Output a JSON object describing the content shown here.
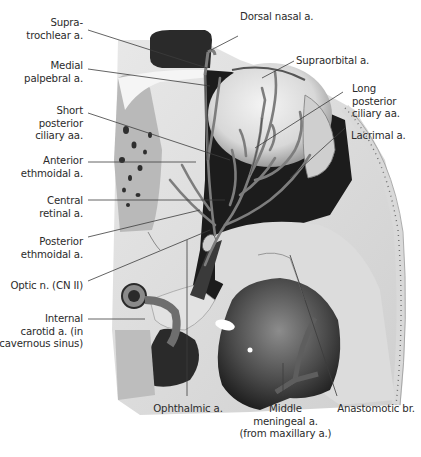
{
  "figure": {
    "palette": {
      "background": "#ffffff",
      "bone_light": "#e6e6e6",
      "bone_mid": "#c9c9c9",
      "shadow_dark": "#1e1e1e",
      "vessel": "#7d7d7d",
      "vessel_edge": "#3a3a3a",
      "leader_line": "#3c3c3c",
      "label_text": "#2b2b2b"
    }
  },
  "labels": {
    "left": [
      {
        "id": "supratrochlear",
        "text": "Supra-\ntrochlear a."
      },
      {
        "id": "medial-palpebral",
        "text": "Medial\npalpebral a."
      },
      {
        "id": "short-posterior-ciliary",
        "text": "Short\nposterior\nciliary aa."
      },
      {
        "id": "anterior-ethmoidal",
        "text": "Anterior\nethmoidal a."
      },
      {
        "id": "central-retinal",
        "text": "Central\nretinal a."
      },
      {
        "id": "posterior-ethmoidal",
        "text": "Posterior\nethmoidal a."
      },
      {
        "id": "optic-nerve",
        "text": "Optic n. (CN II)"
      },
      {
        "id": "internal-carotid",
        "text": "Internal\ncarotid a. (in\ncavernous sinus)"
      }
    ],
    "right": [
      {
        "id": "dorsal-nasal",
        "text": "Dorsal nasal a."
      },
      {
        "id": "supraorbital",
        "text": "Supraorbital a."
      },
      {
        "id": "long-posterior-ciliary",
        "text": "Long\nposterior\nciliary aa."
      },
      {
        "id": "lacrimal",
        "text": "Lacrimal a."
      }
    ],
    "bottom": [
      {
        "id": "ophthalmic",
        "text": "Ophthalmic a."
      },
      {
        "id": "middle-meningeal",
        "text": "Middle\nmeningeal a.\n(from maxillary a.)"
      },
      {
        "id": "anastomotic",
        "text": "Anastomotic br."
      }
    ]
  }
}
